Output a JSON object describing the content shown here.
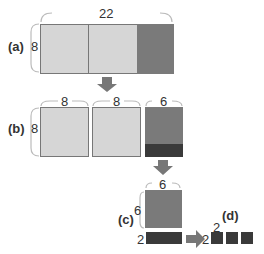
{
  "panels": {
    "a": {
      "label": "(a)",
      "width": "22",
      "height": "8"
    },
    "b": {
      "label": "(b)",
      "widths": [
        "8",
        "8",
        "6"
      ],
      "height": "8"
    },
    "c": {
      "label": "(c)",
      "width": "6",
      "height": "6",
      "strip_height": "2"
    },
    "d": {
      "label": "(d)",
      "block_size": "2",
      "height_label": "2"
    }
  },
  "colors": {
    "light": "#d6d6d6",
    "medium": "#7a7a7a",
    "dark": "#3a3a3a",
    "arrow": "#777777"
  }
}
